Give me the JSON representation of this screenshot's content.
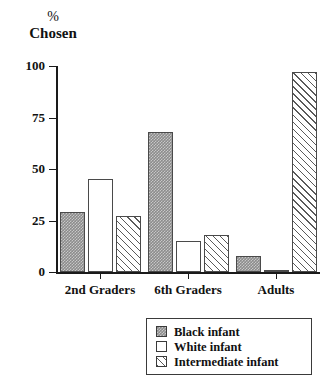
{
  "chart_data": {
    "type": "bar",
    "title": "",
    "subtitle": "",
    "xlabel": "",
    "ylabel": "% Chosen",
    "ylabel_lines": [
      "%",
      "Chosen"
    ],
    "ylim": [
      0,
      100
    ],
    "yticks": [
      0,
      25,
      50,
      75,
      100
    ],
    "ytick_labels": [
      "0",
      "25",
      "50",
      "75",
      "100"
    ],
    "grid": false,
    "legend_position": "bottom-right",
    "categories": [
      "2nd Graders",
      "6th Graders",
      "Adults"
    ],
    "series": [
      {
        "name": "Black infant",
        "fill": "solid-gray",
        "values": [
          29,
          68,
          8
        ]
      },
      {
        "name": "White infant",
        "fill": "open-white",
        "values": [
          45,
          15,
          1
        ]
      },
      {
        "name": "Intermediate infant",
        "fill": "diagonal-hatch",
        "values": [
          27,
          18,
          97
        ]
      }
    ],
    "colors": {
      "axis": "#1a1a1a",
      "bar_outline": "#4a4a4a",
      "black_infant_fill": "#8c8c8c",
      "white_infant_fill": "#ffffff",
      "intermediate_infant_hatch": "#5a5a5a",
      "background": "#ffffff"
    }
  },
  "axis": {
    "y_title_pct": "%",
    "y_title_word": "Chosen"
  },
  "legend": {
    "items": [
      {
        "label": "Black infant"
      },
      {
        "label": "White infant"
      },
      {
        "label": "Intermediate infant"
      }
    ]
  }
}
